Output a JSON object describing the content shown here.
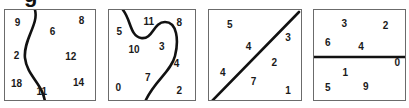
{
  "figure": {
    "caption_fragment": "g",
    "background_color": "#ffffff",
    "border_color": "#6b6b6b",
    "ink_color": "#111111",
    "number_color": "#1a1a1a"
  },
  "panels": [
    {
      "id": "panel-1",
      "divider_type": "s-curve-vertical",
      "divider_path": "M 30 0 C 34 14, 18 30, 20 48 C 22 66, 38 74, 40 92",
      "numbers": [
        {
          "value": "9",
          "x": 13,
          "y": 13
        },
        {
          "value": "6",
          "x": 49,
          "y": 22
        },
        {
          "value": "8",
          "x": 79,
          "y": 11
        },
        {
          "value": "2",
          "x": 12,
          "y": 47
        },
        {
          "value": "12",
          "x": 68,
          "y": 48
        },
        {
          "value": "18",
          "x": 12,
          "y": 76
        },
        {
          "value": "11",
          "x": 38,
          "y": 84
        },
        {
          "value": "14",
          "x": 76,
          "y": 75
        }
      ]
    },
    {
      "id": "panel-2",
      "divider_type": "hook-curve",
      "divider_path": "M 14 0 C 22 10, 21 26, 32 28 C 44 30, 44 12, 56 12 C 68 12, 70 30, 66 46 C 62 62, 44 72, 36 92",
      "numbers": [
        {
          "value": "5",
          "x": 11,
          "y": 22
        },
        {
          "value": "11",
          "x": 43,
          "y": 12
        },
        {
          "value": "8",
          "x": 76,
          "y": 13
        },
        {
          "value": "10",
          "x": 27,
          "y": 41
        },
        {
          "value": "3",
          "x": 57,
          "y": 38
        },
        {
          "value": "4",
          "x": 73,
          "y": 55
        },
        {
          "value": "7",
          "x": 42,
          "y": 70
        },
        {
          "value": "0",
          "x": 10,
          "y": 80
        },
        {
          "value": "2",
          "x": 76,
          "y": 83
        }
      ]
    },
    {
      "id": "panel-3",
      "divider_type": "diagonal-line",
      "divider_path": "M 2 92 L 90 2",
      "numbers": [
        {
          "value": "5",
          "x": 21,
          "y": 15
        },
        {
          "value": "3",
          "x": 80,
          "y": 29
        },
        {
          "value": "4",
          "x": 40,
          "y": 38
        },
        {
          "value": "2",
          "x": 66,
          "y": 54
        },
        {
          "value": "4",
          "x": 14,
          "y": 64
        },
        {
          "value": "7",
          "x": 45,
          "y": 74
        },
        {
          "value": "1",
          "x": 80,
          "y": 83
        }
      ]
    },
    {
      "id": "panel-4",
      "divider_type": "horizontal-line",
      "divider_path": "M 0 47 L 93 47",
      "numbers": [
        {
          "value": "3",
          "x": 31,
          "y": 14
        },
        {
          "value": "2",
          "x": 73,
          "y": 16
        },
        {
          "value": "6",
          "x": 14,
          "y": 34
        },
        {
          "value": "4",
          "x": 48,
          "y": 38
        },
        {
          "value": "0",
          "x": 85,
          "y": 54
        },
        {
          "value": "1",
          "x": 32,
          "y": 64
        },
        {
          "value": "5",
          "x": 14,
          "y": 80
        },
        {
          "value": "9",
          "x": 53,
          "y": 79
        }
      ]
    }
  ]
}
